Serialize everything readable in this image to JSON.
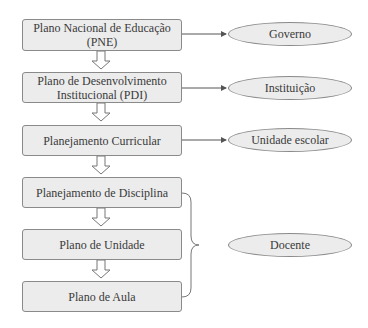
{
  "diagram": {
    "boxes": [
      {
        "label": "Plano Nacional de Educação (PNE)"
      },
      {
        "label": "Plano de Desenvolvimento Institucional (PDI)"
      },
      {
        "label": "Planejamento Curricular"
      },
      {
        "label": "Planejamento de Disciplina"
      },
      {
        "label": "Plano de Unidade"
      },
      {
        "label": "Plano de Aula"
      }
    ],
    "actors": [
      {
        "label": "Governo"
      },
      {
        "label": "Instituição"
      },
      {
        "label": "Unidade escolar"
      },
      {
        "label": "Docente"
      }
    ],
    "colors": {
      "fill": "#ececec",
      "stroke": "#8a8a8a",
      "text": "#3a3a3a"
    }
  }
}
